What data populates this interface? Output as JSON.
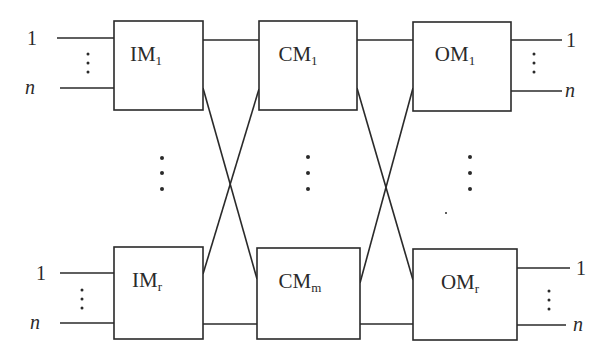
{
  "diagram": {
    "type": "three-stage Clos switching network",
    "stages": [
      {
        "name": "input-stage",
        "modules": [
          {
            "id": "IM1",
            "base": "IM",
            "sub": "1"
          },
          {
            "id": "IMr",
            "base": "IM",
            "sub": "r"
          }
        ]
      },
      {
        "name": "center-stage",
        "modules": [
          {
            "id": "CM1",
            "base": "CM",
            "sub": "1"
          },
          {
            "id": "CMm",
            "base": "CM",
            "sub": "m"
          }
        ]
      },
      {
        "name": "output-stage",
        "modules": [
          {
            "id": "OM1",
            "base": "OM",
            "sub": "1"
          },
          {
            "id": "OMr",
            "base": "OM",
            "sub": "r"
          }
        ]
      }
    ],
    "port_labels": {
      "first": "1",
      "last": "n"
    },
    "ellipsis": "⋮",
    "connections": [
      [
        "IM1",
        "CM1"
      ],
      [
        "IM1",
        "CMm"
      ],
      [
        "IMr",
        "CM1"
      ],
      [
        "IMr",
        "CMm"
      ],
      [
        "CM1",
        "OM1"
      ],
      [
        "CM1",
        "OMr"
      ],
      [
        "CMm",
        "OM1"
      ],
      [
        "CMm",
        "OMr"
      ]
    ]
  }
}
